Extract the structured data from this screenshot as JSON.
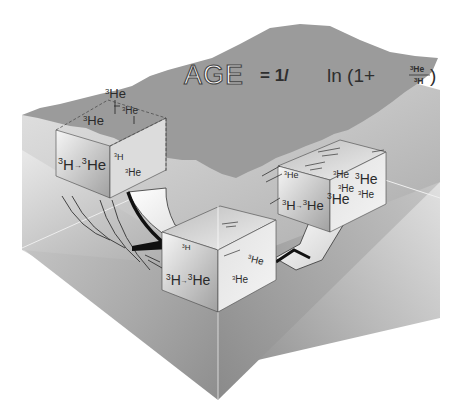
{
  "diagram": {
    "formula": {
      "lhs": "AGE",
      "equals": "= 1/",
      "ln": "ln (1+",
      "numerator": "He",
      "numerator_sup": "3",
      "denominator": "H",
      "denominator_sup": "3",
      "close": ")"
    },
    "surface_parcel": {
      "top_label": {
        "sup": "3",
        "text": "He"
      },
      "top_face_labels": [
        {
          "sup": "3",
          "text": "He"
        },
        {
          "sup": "3",
          "text": "He"
        }
      ],
      "front_label": {
        "sup1": "3",
        "t1": "H",
        "arrow": "→",
        "sup2": "3",
        "t2": "He"
      },
      "side_labels": [
        {
          "sup": "3",
          "text": "H"
        },
        {
          "sup": "3",
          "text": "He"
        }
      ]
    },
    "middle_parcel": {
      "front_label": {
        "sup1": "3",
        "t1": "H",
        "arrow": "→",
        "sup2": "3",
        "t2": "He"
      },
      "front_small": {
        "sup": "3",
        "text": "H"
      },
      "side_labels": [
        {
          "sup": "3",
          "text": "He"
        },
        {
          "sup": "3",
          "text": "He"
        }
      ]
    },
    "deep_parcel": {
      "front_label": {
        "sup1": "3",
        "t1": "H",
        "arrow": "→",
        "sup2": "3",
        "t2": "He"
      },
      "front_small": {
        "sup": "3",
        "text": "He"
      },
      "side_labels": [
        {
          "sup": "3",
          "text": "He"
        },
        {
          "sup": "3",
          "text": "He"
        },
        {
          "sup": "3",
          "text": "He"
        },
        {
          "sup": "3",
          "text": "He"
        },
        {
          "sup": "3",
          "text": "He"
        }
      ]
    },
    "colors": {
      "surface": "#9a9a9a",
      "box_light": "#efefef",
      "box_dark": "#8c8c8c",
      "ink": "#222222"
    }
  }
}
